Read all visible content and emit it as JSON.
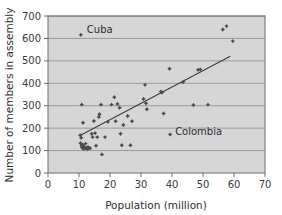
{
  "chart_data": {
    "type": "scatter",
    "title": "",
    "xlabel": "Population (million)",
    "ylabel": "Number of members in assembly",
    "xlim": [
      0,
      70
    ],
    "ylim": [
      0,
      700
    ],
    "xticks": [
      0,
      10,
      20,
      30,
      40,
      50,
      60,
      70
    ],
    "yticks": [
      0,
      100,
      200,
      300,
      400,
      500,
      600,
      700
    ],
    "grid": "horizontal",
    "legend": null,
    "background": "#d6d6d6",
    "marker_color": "#4a4a52",
    "trendline_color": "#3d3d45",
    "points": [
      [
        10.6,
        616
      ],
      [
        10.9,
        305
      ],
      [
        11.3,
        224
      ],
      [
        10.4,
        168
      ],
      [
        10.7,
        157
      ],
      [
        10.5,
        133
      ],
      [
        10.8,
        121
      ],
      [
        11.0,
        113
      ],
      [
        11.2,
        126
      ],
      [
        11.4,
        108
      ],
      [
        11.6,
        118
      ],
      [
        11.9,
        110
      ],
      [
        12.1,
        131
      ],
      [
        12.3,
        112
      ],
      [
        12.6,
        107
      ],
      [
        12.9,
        116
      ],
      [
        13.2,
        109
      ],
      [
        13.6,
        111
      ],
      [
        14.1,
        175
      ],
      [
        14.4,
        160
      ],
      [
        14.8,
        232
      ],
      [
        15.2,
        178
      ],
      [
        15.5,
        122
      ],
      [
        15.9,
        160
      ],
      [
        16.4,
        250
      ],
      [
        16.6,
        262
      ],
      [
        17.1,
        305
      ],
      [
        17.4,
        83
      ],
      [
        18.4,
        160
      ],
      [
        19.3,
        228
      ],
      [
        20.5,
        305
      ],
      [
        21.4,
        338
      ],
      [
        21.8,
        231
      ],
      [
        22.4,
        308
      ],
      [
        23.1,
        291
      ],
      [
        23.4,
        175
      ],
      [
        23.8,
        124
      ],
      [
        24.3,
        214
      ],
      [
        25.7,
        254
      ],
      [
        26.6,
        124
      ],
      [
        27.1,
        231
      ],
      [
        30.8,
        330
      ],
      [
        31.3,
        393
      ],
      [
        31.6,
        311
      ],
      [
        31.9,
        284
      ],
      [
        36.4,
        363
      ],
      [
        36.8,
        359
      ],
      [
        37.3,
        265
      ],
      [
        39.2,
        465
      ],
      [
        39.4,
        172
      ],
      [
        43.6,
        406
      ],
      [
        46.9,
        303
      ],
      [
        48.4,
        460
      ],
      [
        49.1,
        462
      ],
      [
        51.6,
        305
      ],
      [
        56.4,
        640
      ],
      [
        57.6,
        655
      ],
      [
        59.6,
        588
      ]
    ],
    "trendline": {
      "x_start": 10.5,
      "y_start": 168,
      "x_end": 58.8,
      "y_end": 521
    },
    "annotations": [
      {
        "text": "Cuba",
        "x": 10.6,
        "y": 616,
        "label_dx": 6,
        "label_dy": -2
      },
      {
        "text": "Colombia",
        "x": 39.4,
        "y": 172,
        "label_dx": 5,
        "label_dy": 1
      }
    ]
  }
}
